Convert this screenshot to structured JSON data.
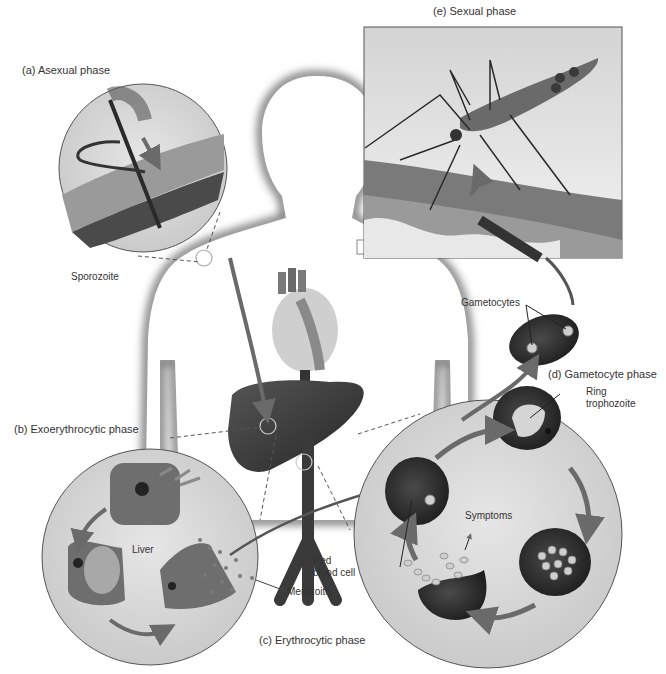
{
  "diagram": {
    "phases": [
      {
        "id": "a",
        "label": "(a)  Asexual phase"
      },
      {
        "id": "b",
        "label": "(b)  Exoerythrocytic phase"
      },
      {
        "id": "c",
        "label": "(c)  Erythrocytic phase"
      },
      {
        "id": "d",
        "label": "(d)  Gametocyte phase"
      },
      {
        "id": "e",
        "label": "(e)  Sexual phase"
      }
    ],
    "annotations": {
      "sporozoite": "Sporozoite",
      "gametocytes": "Gametocytes",
      "ring_trophozoite_1": "Ring",
      "ring_trophozoite_2": "trophozoite",
      "symptoms": "Symptoms",
      "red_blood_cell_1": "Red",
      "red_blood_cell_2": "blood cell",
      "liver": "Liver",
      "merozoite": "Merozoite"
    },
    "colors": {
      "background": "#ffffff",
      "inset_fill": "#d9d9d9",
      "cell_dark": "#2e2e2e",
      "liver_tissue": "#6e6e6e",
      "arrow": "#6a6a6a",
      "label_text": "#333333"
    }
  }
}
